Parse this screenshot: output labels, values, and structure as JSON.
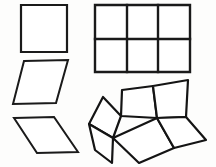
{
  "figure": {
    "background_color": "#fdfdfc",
    "stroke_color": "#1a1a1a",
    "fill_color": "#ffffff",
    "canvas": {
      "width": 216,
      "height": 167
    },
    "shapes": [
      {
        "id": "square",
        "name": "square",
        "label": "Square",
        "position": "top-left",
        "stroke_width": 2.2,
        "points": "21,5 67,5 67,52 21,52"
      },
      {
        "id": "grid-rectangle",
        "name": "rectangle-grid-3x2",
        "label": "Rectangle divided into 3 by 2 grid of squares",
        "position": "top-right",
        "stroke_width": 2.4,
        "columns": 3,
        "rows": 2,
        "points": "95,5 190,5 190,72 95,72",
        "interior_lines": [
          {
            "name": "vertical-divider-1",
            "x1": 127,
            "y1": 5,
            "x2": 127,
            "y2": 72
          },
          {
            "name": "vertical-divider-2",
            "x1": 158,
            "y1": 5,
            "x2": 158,
            "y2": 72
          },
          {
            "name": "horizontal-divider-1",
            "x1": 95,
            "y1": 39,
            "x2": 190,
            "y2": 39
          }
        ]
      },
      {
        "id": "rhombus-steep",
        "name": "parallelogram-steep",
        "label": "Parallelogram leaning right (steep)",
        "position": "middle-left",
        "stroke_width": 2.0,
        "points": "24,61 68,60 56,103 13,104"
      },
      {
        "id": "rhombus-flat",
        "name": "parallelogram-flat",
        "label": "Parallelogram leaning right (flat)",
        "position": "bottom-left",
        "stroke_width": 2.0,
        "points": "14,118 54,117 78,152 37,153"
      }
    ],
    "net": {
      "id": "rhombi-net",
      "name": "rhombi-net-isometric",
      "label": "Isometric net of six rhombi forming folded surface",
      "position": "bottom-right",
      "stroke_width": 2.2,
      "faces": [
        {
          "id": "face-left-upper",
          "name": "net-face-left-upper",
          "points": "103,97 121,116 113,138 89,124"
        },
        {
          "id": "face-center-upper",
          "name": "net-face-center-upper",
          "points": "121,116 122,90 153,86 157,118"
        },
        {
          "id": "face-right-upper",
          "name": "net-face-right-upper",
          "points": "153,86 188,80 186,117 157,118"
        },
        {
          "id": "face-left-lower",
          "name": "net-face-left-lower",
          "points": "89,124 113,138 112,163 95,150"
        },
        {
          "id": "face-center-lower",
          "name": "net-face-center-lower",
          "points": "113,138 157,118 174,148 139,163"
        },
        {
          "id": "face-right-lower",
          "name": "net-face-right-lower",
          "points": "157,118 186,117 206,140 174,148"
        }
      ]
    }
  }
}
